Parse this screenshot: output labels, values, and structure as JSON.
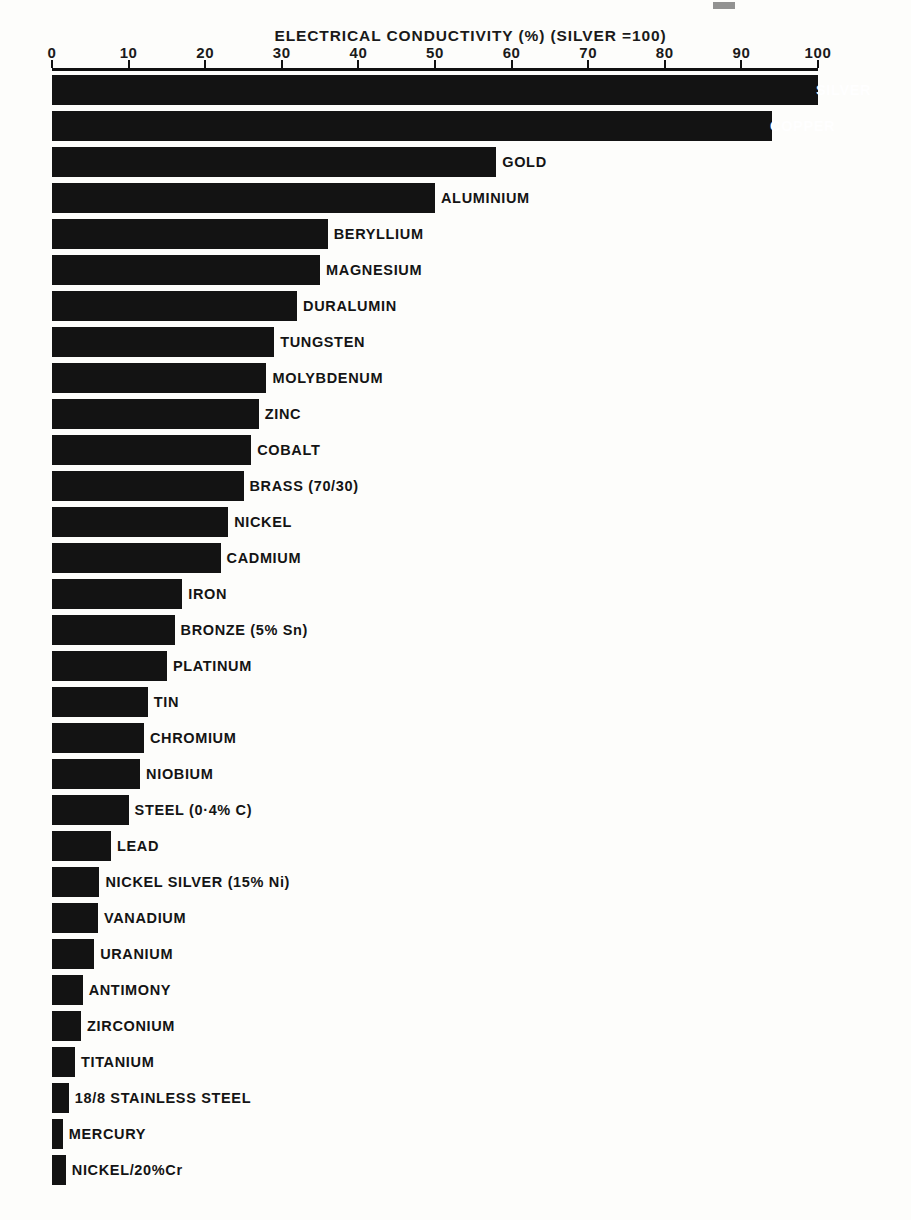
{
  "chart_data": {
    "type": "bar",
    "orientation": "horizontal",
    "title": "ELECTRICAL CONDUCTIVITY (%) (SILVER =100)",
    "xlabel": "",
    "ylabel": "",
    "xlim": [
      0,
      100
    ],
    "grid": false,
    "legend": "none",
    "xticks": [
      "0",
      "10",
      "20",
      "30",
      "40",
      "50",
      "60",
      "70",
      "80",
      "90",
      "100"
    ],
    "xtick_values": [
      0,
      10,
      20,
      30,
      40,
      50,
      60,
      70,
      80,
      90,
      100
    ],
    "categories": [
      "SILVER",
      "COPPER",
      "GOLD",
      "ALUMINIUM",
      "BERYLLIUM",
      "MAGNESIUM",
      "DURALUMIN",
      "TUNGSTEN",
      "MOLYBDENUM",
      "ZINC",
      "COBALT",
      "BRASS (70/30)",
      "NICKEL",
      "CADMIUM",
      "IRON",
      "BRONZE (5% Sn)",
      "PLATINUM",
      "TIN",
      "CHROMIUM",
      "NIOBIUM",
      "STEEL (0·4% C)",
      "LEAD",
      "NICKEL SILVER (15% Ni)",
      "VANADIUM",
      "URANIUM",
      "ANTIMONY",
      "ZIRCONIUM",
      "TITANIUM",
      "18/8 STAINLESS STEEL",
      "MERCURY",
      "NICKEL/20%Cr"
    ],
    "values": [
      100,
      94,
      58,
      50,
      36,
      35,
      32,
      29,
      28,
      27,
      26,
      25,
      23,
      22,
      17,
      16,
      15,
      12.5,
      12,
      11.5,
      10,
      7.7,
      6.2,
      6,
      5.5,
      4,
      3.8,
      3,
      2.2,
      1.4,
      1.8
    ],
    "series": [
      {
        "name": "Electrical conductivity (% IACS, silver = 100)",
        "values": [
          100,
          94,
          58,
          50,
          36,
          35,
          32,
          29,
          28,
          27,
          26,
          25,
          23,
          22,
          17,
          16,
          15,
          12.5,
          12,
          11.5,
          10,
          7.7,
          6.2,
          6,
          5.5,
          4,
          3.8,
          3,
          2.2,
          1.4,
          1.8
        ]
      }
    ],
    "bar_color": "#131313",
    "background_color": "#fdfdfb",
    "axis_color": "#111111",
    "label_placement": "to the right of each bar end; SILVER and COPPER labels overlap the bar and are drawn in white"
  }
}
